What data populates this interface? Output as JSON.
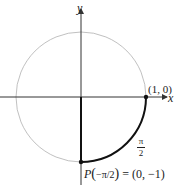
{
  "diagram": {
    "axes": {
      "x_label": "x",
      "y_label": "y"
    },
    "points": {
      "start": {
        "label": "(1, 0)"
      },
      "end": {
        "label_prefix": "P",
        "label_arg": "−π/2",
        "label_value": "= (0, −1)"
      }
    },
    "arc_label": {
      "numerator": "π",
      "denominator": "2"
    },
    "colors": {
      "circle": "#b0b0b0",
      "axes": "#333333",
      "arc": "#111111"
    }
  }
}
